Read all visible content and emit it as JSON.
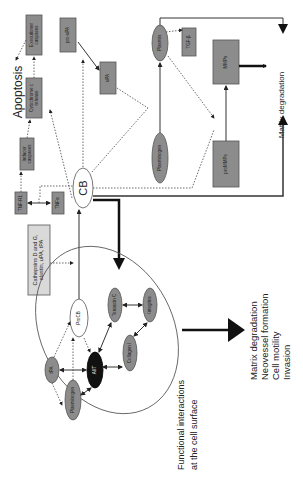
{
  "figure": {
    "orientation": "rotated 90 degrees counter-clockwise (text reads bottom-to-top)",
    "center_node": "CB",
    "apoptosis": {
      "label": "Apoptosis",
      "nodes": [
        "TNF-R1",
        "TNFa",
        "Inducer caspases",
        "Cytochrome c release",
        "Executioner caspases"
      ]
    },
    "upa": {
      "nodes": [
        "pro-uPA",
        "uPA"
      ]
    },
    "plasmin_path": {
      "nodes": [
        "Plasminogen",
        "Plasmin",
        "TGF-β",
        "proMMPs",
        "MMPs"
      ],
      "output": "Matrix degradation"
    },
    "secreted": {
      "label": "Cathepsins D and G, elastin, uPA, tPA"
    },
    "cell_surface": {
      "nodes": [
        "ProCB",
        "AIIT",
        "Tenascin C",
        "Integrins",
        "Collagen I",
        "tPA",
        "Plasminogen"
      ],
      "caption_line1": "Functional interactions",
      "caption_line2": "at the cell surface"
    },
    "outcomes": [
      "Matrix degradation",
      "Neovessel formation",
      "Cell motility",
      "Invasion"
    ]
  }
}
